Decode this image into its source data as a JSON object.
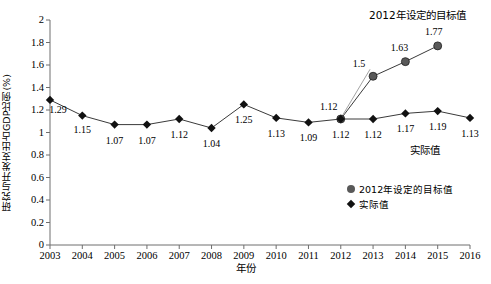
{
  "chart_data": {
    "type": "line",
    "title": "",
    "xlabel": "年份",
    "ylabel": "研究与开发支出占GDP比例(%)",
    "categories": [
      "2003",
      "2004",
      "2005",
      "2006",
      "2007",
      "2008",
      "2009",
      "2010",
      "2011",
      "2012",
      "2013",
      "2014",
      "2015",
      "2016"
    ],
    "x": [
      2003,
      2004,
      2005,
      2006,
      2007,
      2008,
      2009,
      2010,
      2011,
      2012,
      2013,
      2014,
      2015,
      2016
    ],
    "ylim": [
      0,
      2
    ],
    "yticks": [
      "0",
      "0.2",
      "0.4",
      "0.6",
      "0.8",
      "1",
      "1.2",
      "1.4",
      "1.6",
      "1.8",
      "2"
    ],
    "ytick_values": [
      0,
      0.2,
      0.4,
      0.6,
      0.8,
      1,
      1.2,
      1.4,
      1.6,
      1.8,
      2
    ],
    "grid": false,
    "legend_position": "bottom-right",
    "series": [
      {
        "name": "2012年设定的目标值",
        "marker": "circle",
        "color": "#595959",
        "x": [
          2012,
          2013,
          2014,
          2015
        ],
        "values": [
          1.12,
          1.5,
          1.63,
          1.77
        ],
        "labels": [
          "1.12",
          "1.5",
          "1.63",
          "1.77"
        ]
      },
      {
        "name": "实际值",
        "marker": "diamond",
        "color": "#111111",
        "x": [
          2003,
          2004,
          2005,
          2006,
          2007,
          2008,
          2009,
          2010,
          2011,
          2012,
          2013,
          2014,
          2015,
          2016
        ],
        "values": [
          1.29,
          1.15,
          1.07,
          1.07,
          1.12,
          1.04,
          1.25,
          1.13,
          1.09,
          1.12,
          1.12,
          1.17,
          1.19,
          1.13
        ],
        "labels": [
          "1.29",
          "1.15",
          "1.07",
          "1.07",
          "1.12",
          "1.04",
          "1.25",
          "1.13",
          "1.09",
          "1.12",
          "1.12",
          "1.17",
          "1.19",
          "1.13"
        ]
      }
    ],
    "annotations": [
      {
        "text": "2012年设定的目标值",
        "position": "top-right"
      },
      {
        "text": "实际值",
        "position": "bottom-right"
      }
    ]
  },
  "legend": {
    "items": [
      {
        "label": "2012年设定的目标值",
        "marker": "circle"
      },
      {
        "label": "实际值",
        "marker": "diamond"
      }
    ]
  },
  "colors": {
    "target_series": "#595959",
    "actual_series": "#111111",
    "axis": "#6e6e6e"
  }
}
